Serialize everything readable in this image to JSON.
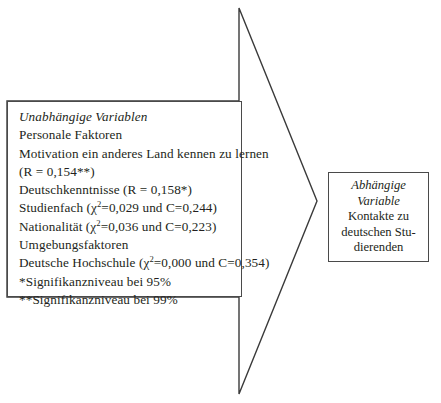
{
  "diagram": {
    "type": "flow-diagram",
    "title_visible": false,
    "colors": {
      "background": "#ffffff",
      "text": "#231f20",
      "border": "#4a4a4a",
      "arrow_stroke": "#3a3a3a"
    },
    "arrow": {
      "name": "right-pointing-arrow",
      "direction": "right",
      "points": "239,8 317,201 239,394 239,297 7,297 7,101 239,101 239,8"
    },
    "independent": {
      "heading": "Unabhängige Variablen",
      "lines": [
        {
          "text": "Unabhängige Variablen",
          "italic": true,
          "chi": false
        },
        {
          "text": "Personale Faktoren",
          "italic": false,
          "chi": false
        },
        {
          "text": "Motivation ein anderes Land kennen zu lernen",
          "italic": false,
          "chi": false
        },
        {
          "text": "(R = 0,154**)",
          "italic": false,
          "chi": false
        },
        {
          "text": "Deutschkenntnisse (R = 0,158*)",
          "italic": false,
          "chi": false
        },
        {
          "text": "Studienfach (",
          "italic": false,
          "chi": true,
          "after": "=0,029 und C=0,244)"
        },
        {
          "text": "Nationalität (",
          "italic": false,
          "chi": true,
          "after": "=0,036 und C=0,223)"
        },
        {
          "text": "Umgebungsfaktoren",
          "italic": false,
          "chi": false
        },
        {
          "text": "Deutsche Hochschule (",
          "italic": false,
          "chi": true,
          "after": "=0,000 und C=0,354)"
        },
        {
          "text": "*Signifikanzniveau bei 95%",
          "italic": false,
          "chi": false
        },
        {
          "text": "**Signifikanzniveau bei 99%",
          "italic": false,
          "chi": false
        }
      ],
      "chi_symbol": "χ",
      "chi_superscript": "2"
    },
    "dependent": {
      "lines": [
        {
          "text": "Abhängige",
          "italic": true
        },
        {
          "text": "Variable",
          "italic": true
        },
        {
          "text": "Kontakte zu",
          "italic": false
        },
        {
          "text": "deutschen Stu-",
          "italic": false
        },
        {
          "text": "dierenden",
          "italic": false
        }
      ]
    }
  }
}
